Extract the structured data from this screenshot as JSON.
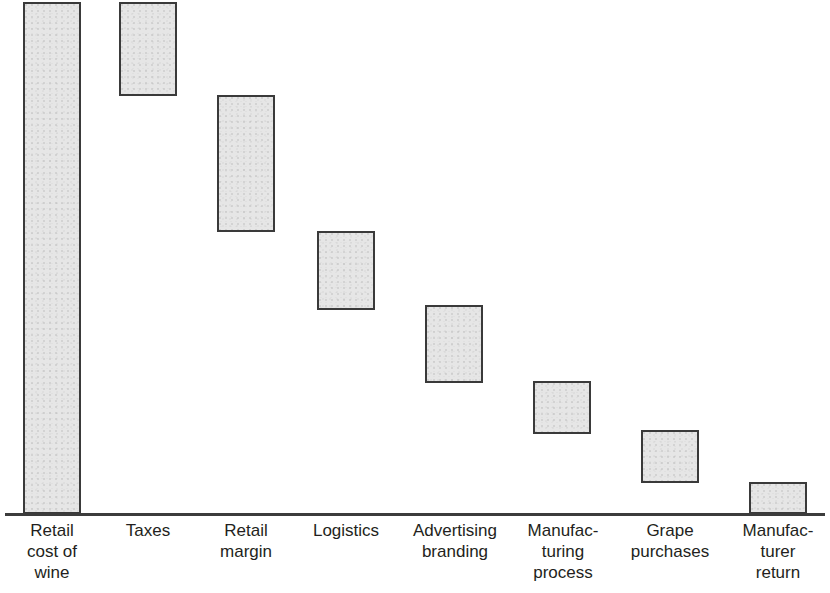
{
  "chart_data": {
    "type": "bar",
    "chart_subtype": "waterfall",
    "title": "",
    "subtitle": "",
    "xlabel": "",
    "ylabel": "",
    "grid": false,
    "legend": null,
    "axis": {
      "baseline_visible": true,
      "y_axis_visible": false,
      "y_ticks": [],
      "ylim": [
        0,
        100
      ]
    },
    "categories": [
      "Retail\ncost of\nwine",
      "Taxes",
      "Retail\nmargin",
      "Logistics",
      "Advertising\nbranding",
      "Manufac-\nturing\nprocess",
      "Grape\npurchases",
      "Manufac-\nturer\nreturn"
    ],
    "values": [
      100,
      18,
      27,
      15.5,
      15,
      10,
      10,
      6
    ],
    "cumulative_top": [
      100,
      100,
      82,
      55,
      40,
      25,
      15,
      6
    ],
    "cumulative_bottom": [
      0,
      82,
      55,
      40,
      25,
      15,
      6,
      0
    ],
    "bars": [
      {
        "label": "Retail cost of wine",
        "x": 23,
        "width": 58,
        "top": 2,
        "bottom": 514,
        "value": 100,
        "start": 0,
        "end": 100
      },
      {
        "label": "Taxes",
        "x": 119,
        "width": 58,
        "top": 2,
        "bottom": 96,
        "value": 18,
        "start": 82,
        "end": 100
      },
      {
        "label": "Retail margin",
        "x": 217,
        "width": 58,
        "top": 95,
        "bottom": 232,
        "value": 27,
        "start": 55,
        "end": 82
      },
      {
        "label": "Logistics",
        "x": 317,
        "width": 58,
        "top": 231,
        "bottom": 310,
        "value": 15.5,
        "start": 40,
        "end": 55
      },
      {
        "label": "Advertising branding",
        "x": 425,
        "width": 58,
        "top": 305,
        "bottom": 383,
        "value": 15,
        "start": 25,
        "end": 40
      },
      {
        "label": "Manufacturing process",
        "x": 533,
        "width": 58,
        "top": 381,
        "bottom": 434,
        "value": 10,
        "start": 15,
        "end": 25
      },
      {
        "label": "Grape purchases",
        "x": 641,
        "width": 58,
        "top": 430,
        "bottom": 483,
        "value": 10,
        "start": 6,
        "end": 15
      },
      {
        "label": "Manufacturer return",
        "x": 749,
        "width": 58,
        "top": 482,
        "bottom": 514,
        "value": 6,
        "start": 0,
        "end": 6
      }
    ],
    "label_positions": [
      {
        "center": 52,
        "text": "Retail\ncost of\nwine"
      },
      {
        "center": 148,
        "text": "Taxes"
      },
      {
        "center": 246,
        "text": "Retail\nmargin"
      },
      {
        "center": 346,
        "text": "Logistics"
      },
      {
        "center": 455,
        "text": "Advertising\nbranding"
      },
      {
        "center": 563,
        "text": "Manufac-\nturing\nprocess"
      },
      {
        "center": 670,
        "text": "Grape\npurchases"
      },
      {
        "center": 778,
        "text": "Manufac-\nturer\nreturn"
      }
    ],
    "colors": {
      "bar_fill": "#e6e6e6",
      "bar_border": "#3a3a3a",
      "axis": "#3c3c3c",
      "label_text": "#231f20",
      "background": "#ffffff"
    }
  }
}
